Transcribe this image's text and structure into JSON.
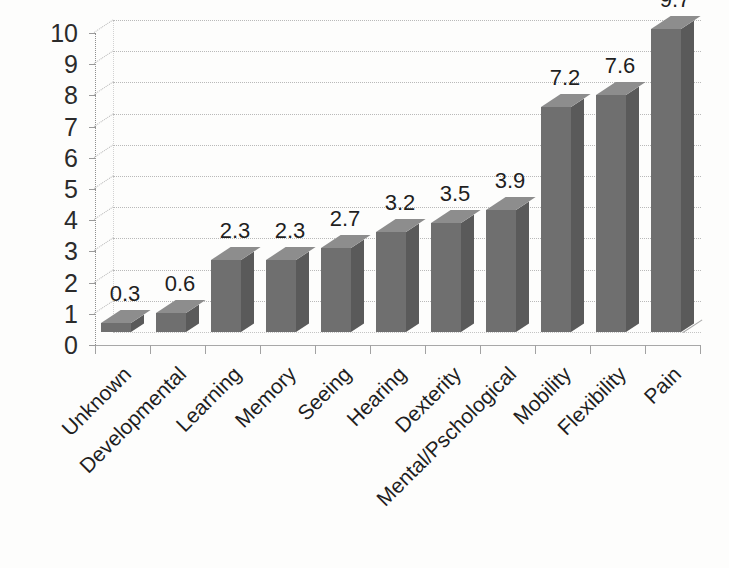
{
  "chart_data": {
    "type": "bar",
    "title": "",
    "subtitle": "",
    "xlabel": "",
    "ylabel": "",
    "ylim": [
      0,
      10
    ],
    "ytick_step": 1,
    "yticks": [
      "0",
      "1",
      "2",
      "3",
      "4",
      "5",
      "6",
      "7",
      "8",
      "9",
      "10"
    ],
    "grid": true,
    "grid_style": "dotted-horizontal-3d",
    "legend": false,
    "legend_position": "none",
    "three_d": true,
    "categories": [
      "Unknown",
      "Developmental",
      "Learning",
      "Memory",
      "Seeing",
      "Hearing",
      "Dexterity",
      "Mental/Pschological",
      "Mobility",
      "Flexibility",
      "Pain"
    ],
    "values": [
      0.3,
      0.6,
      2.3,
      2.3,
      2.7,
      3.2,
      3.5,
      3.9,
      7.2,
      7.6,
      9.7
    ],
    "data_labels": [
      "0.3",
      "0.6",
      "2.3",
      "2.3",
      "2.7",
      "3.2",
      "3.5",
      "3.9",
      "7.2",
      "7.6",
      "9.7"
    ],
    "series": [
      {
        "name": "",
        "values": [
          0.3,
          0.6,
          2.3,
          2.3,
          2.7,
          3.2,
          3.5,
          3.9,
          7.2,
          7.6,
          9.7
        ]
      }
    ]
  },
  "colors": {
    "bar_front": "#6f6f6f",
    "bar_side": "#5a5a5a",
    "bar_top": "#8d8d8d",
    "gridline": "#b9b9b9",
    "axis": "#a2a2a2",
    "text": "#1f1f1f",
    "background": "#fdfdfc"
  }
}
